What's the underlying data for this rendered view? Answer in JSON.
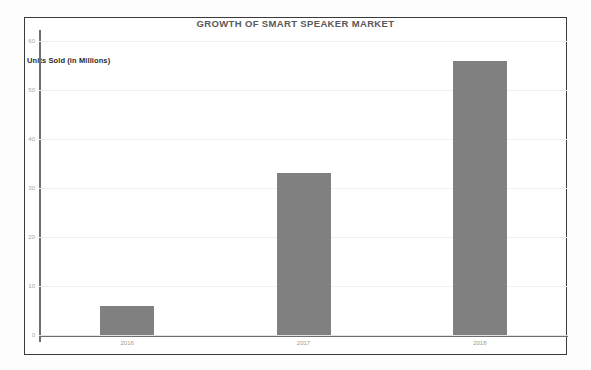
{
  "chart_data": {
    "type": "bar",
    "title": "GROWTH OF SMART SPEAKER MARKET",
    "ylabel": "Units Sold (in Millions)",
    "xlabel": "",
    "categories": [
      "2016",
      "2017",
      "2018"
    ],
    "values": [
      6,
      33,
      56
    ],
    "yticks": [
      "0",
      "10",
      "20",
      "30",
      "40",
      "50",
      "60"
    ],
    "ytick_values": [
      0,
      10,
      20,
      30,
      40,
      50,
      60
    ],
    "ylim": [
      0,
      60
    ],
    "grid": true,
    "legend": false,
    "bar_color": "#808080",
    "gridline_color": "#efefef",
    "axis_color": "#6f6f70",
    "title_color": "#595959",
    "frame_color": "#3a3a3c"
  }
}
